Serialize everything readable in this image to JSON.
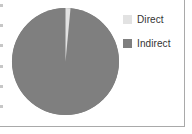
{
  "chart_data": {
    "type": "pie",
    "title": "",
    "categories": [
      "Direct",
      "Indirect"
    ],
    "values": [
      1.5,
      98.5
    ],
    "units": "percent",
    "start_angle_deg": 0,
    "direction": "clockwise",
    "colors": [
      "#e2e2e2",
      "#7f7f7f"
    ],
    "legend": {
      "position": "right",
      "entries": [
        {
          "label": "Direct",
          "color": "#e2e2e2",
          "value": 1.5
        },
        {
          "label": "Indirect",
          "color": "#7f7f7f",
          "value": 98.5
        }
      ]
    },
    "data_labels": false,
    "grid": false,
    "xlabel": "",
    "ylabel": ""
  },
  "panel": {
    "background_color": "#ffffff",
    "border_color": "#a9a9a9"
  },
  "icons": {
    "direct_swatch": "legend-swatch-icon",
    "indirect_swatch": "legend-swatch-icon"
  }
}
